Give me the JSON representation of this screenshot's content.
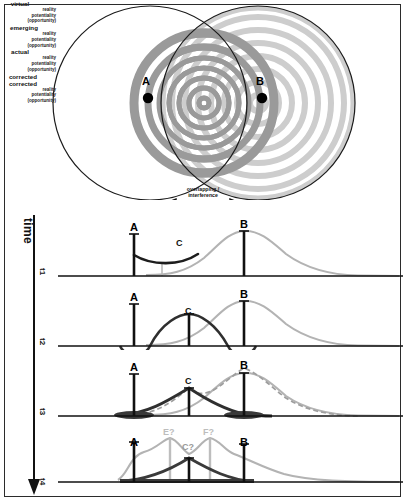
{
  "figure": {
    "title_region": "wave interference emergence diagram",
    "overlap_label_line1": "overlapping /",
    "overlap_label_line2": "interference",
    "time_axis_label": "time",
    "source_a": "A",
    "source_b": "B"
  },
  "legend": {
    "line1": "reality",
    "line2": "potentiality",
    "line3": "(opportunity)"
  },
  "colors": {
    "ink": "#111111",
    "ring_dark": "#9a9a9a",
    "ring_light": "#cdcdcd",
    "curve_gray": "#b3b3b3",
    "curve_dark": "#2f2f2f",
    "frame": "#2b2b2b"
  },
  "panels": [
    {
      "time": "t1",
      "state_label": "virtual",
      "node_label": "C",
      "a_label": "A",
      "b_label": "B",
      "legend": {
        "line1": "reality",
        "line2": "potentiality",
        "line3": "(opportunity)"
      }
    },
    {
      "time": "t2",
      "state_label": "emerging",
      "node_label": "C",
      "a_label": "A",
      "b_label": "B",
      "legend": {
        "line1": "reality",
        "line2": "potentiality",
        "line3": "(opportunity)"
      }
    },
    {
      "time": "t3",
      "state_label": "actual",
      "node_label": "C",
      "a_label": "A",
      "b_label": "B",
      "legend": {
        "line1": "reality",
        "line2": "potentiality",
        "line3": "(opportunity)"
      }
    },
    {
      "time": "t4",
      "state_label": "",
      "node_label": "C?",
      "a_label": "A",
      "b_label": "B",
      "a_note": "corrected",
      "b_note": "corrected",
      "extra_left": "E?",
      "extra_right": "F?",
      "legend": {
        "line1": "reality",
        "line2": "potentiality",
        "line3": "(opportunity)"
      }
    }
  ]
}
